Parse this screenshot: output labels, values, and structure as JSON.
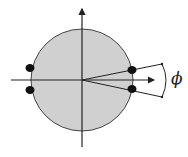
{
  "diagram": {
    "angle_label": "ϕ",
    "colors": {
      "disk_fill": "#d0d0d0",
      "stroke": "#222222",
      "dot": "#111111",
      "background": "#ffffff"
    },
    "elements": {
      "disk": "gray circular disk centered at origin",
      "axes": [
        "horizontal x-axis with arrow",
        "vertical y-axis with arrow"
      ],
      "dots": 4,
      "rays": 2,
      "angle_arc": "arc between two rays labeled phi"
    }
  }
}
